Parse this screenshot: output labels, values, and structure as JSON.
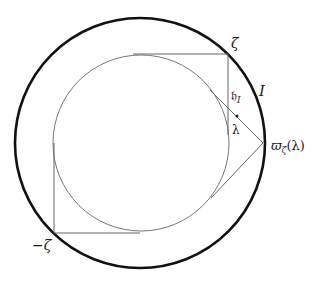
{
  "diagram": {
    "outer_circle": {
      "cx": 140,
      "cy": 143,
      "r": 125,
      "stroke": "#111111",
      "stroke_width": 2.6
    },
    "inner_circle": {
      "cx": 141,
      "cy": 143,
      "r": 88,
      "stroke": "#777777",
      "stroke_width": 1
    },
    "square_path": "M133,54 L228,54 L228,135 M54,143 L54,233 L140,233",
    "tangent_lines": "M210,90 L263,143 L211,198",
    "lambda_point": {
      "cx": 237,
      "cy": 116
    },
    "line_color": "#666666"
  },
  "labels": {
    "zeta": "ζ",
    "neg_zeta": "−ζ",
    "h_I_main": "𝔥",
    "h_I_sub": "I",
    "arc_I": "I",
    "lambda": "λ",
    "varpi_main": "ϖ",
    "varpi_sub": "ζ",
    "varpi_arg": "(λ)"
  }
}
